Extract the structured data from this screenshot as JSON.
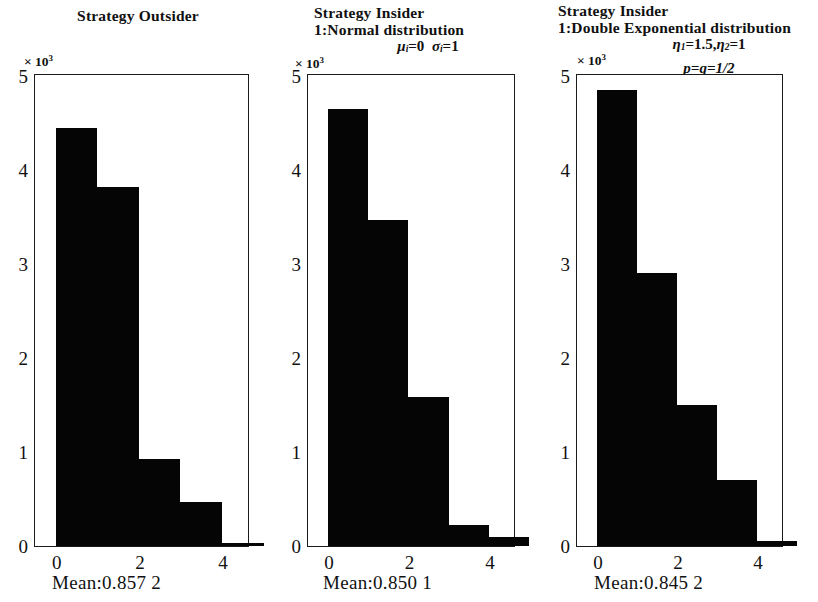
{
  "chart_data": [
    {
      "type": "bar",
      "title": "Strategy Outsider",
      "title_lines": [
        "Strategy Outsider"
      ],
      "params_lines": [],
      "exp_prefix": "× 10",
      "exp_power": "3",
      "categories": [
        "0–1",
        "1–2",
        "2–3",
        "3–4",
        "4–5"
      ],
      "values": [
        4450,
        3820,
        930,
        470,
        30
      ],
      "bin_edges": [
        0,
        1,
        2,
        3,
        4,
        5
      ],
      "xlabel": "",
      "ylabel": "",
      "xticks": [
        "0",
        "2",
        "4"
      ],
      "xtick_values": [
        0,
        2,
        4
      ],
      "yticks": [
        "0",
        "1",
        "2",
        "3",
        "4",
        "5"
      ],
      "ytick_values": [
        0,
        1000,
        2000,
        3000,
        4000,
        5000
      ],
      "ylim": [
        0,
        5000
      ],
      "xlim": [
        -0.5,
        4.6
      ],
      "grid": false,
      "legend": null,
      "caption": "Mean:0.857 2",
      "mean": 0.8572
    },
    {
      "type": "bar",
      "title": "Strategy Insider 1:Normal distribution",
      "title_lines": [
        "Strategy Insider",
        "1:Normal distribution"
      ],
      "params_lines": [
        "μᵢ=0  σᵢ=1"
      ],
      "exp_prefix": "× 10",
      "exp_power": "3",
      "categories": [
        "0–1",
        "1–2",
        "2–3",
        "3–4",
        "4–5"
      ],
      "values": [
        4650,
        3470,
        1580,
        220,
        100
      ],
      "bin_edges": [
        0,
        1,
        2,
        3,
        4,
        5
      ],
      "xlabel": "",
      "ylabel": "",
      "xticks": [
        "0",
        "2",
        "4"
      ],
      "xtick_values": [
        0,
        2,
        4
      ],
      "yticks": [
        "0",
        "1",
        "2",
        "3",
        "4",
        "5"
      ],
      "ytick_values": [
        0,
        1000,
        2000,
        3000,
        4000,
        5000
      ],
      "ylim": [
        0,
        5000
      ],
      "xlim": [
        -0.5,
        4.6
      ],
      "grid": false,
      "legend": null,
      "caption": "Mean:0.850 1",
      "mean": 0.8501
    },
    {
      "type": "bar",
      "title": "Strategy Insider 1:Double Exponential distribution",
      "title_lines": [
        "Strategy Insider",
        "1:Double Exponential distribution"
      ],
      "params_lines": [
        "η₁=1.5,η₂=1",
        "p=q=1/2"
      ],
      "exp_prefix": "× 10",
      "exp_power": "3",
      "categories": [
        "0–1",
        "1–2",
        "2–3",
        "3–4",
        "4–5"
      ],
      "values": [
        4850,
        2900,
        1500,
        700,
        50
      ],
      "bin_edges": [
        0,
        1,
        2,
        3,
        4,
        5
      ],
      "xlabel": "",
      "ylabel": "",
      "xticks": [
        "0",
        "2",
        "4"
      ],
      "xtick_values": [
        0,
        2,
        4
      ],
      "yticks": [
        "0",
        "1",
        "2",
        "3",
        "4",
        "5"
      ],
      "ytick_values": [
        0,
        1000,
        2000,
        3000,
        4000,
        5000
      ],
      "ylim": [
        0,
        5000
      ],
      "xlim": [
        -0.5,
        4.6
      ],
      "grid": false,
      "legend": null,
      "caption": "Mean:0.845 2",
      "mean": 0.8452
    }
  ],
  "panels": [
    {
      "title_line_1": "Strategy Outsider",
      "title_line_2": "",
      "param_line_1": "",
      "param_line_2": "",
      "exp_prefix": "× 10",
      "exp_power": "3",
      "caption": "Mean:0.857 2"
    },
    {
      "title_line_1": "Strategy Insider",
      "title_line_2": "1:Normal distribution",
      "param_line_1": "μ",
      "param_line_1_sub": "i",
      "param_line_1_rest": "=0",
      "param_line_2": "σ",
      "param_line_2_sub": "i",
      "param_line_2_rest": "=1",
      "exp_prefix": "× 10",
      "exp_power": "3",
      "caption": "Mean:0.850 1"
    },
    {
      "title_line_1": "Strategy Insider",
      "title_line_2": "1:Double Exponential distribution",
      "eta1": "η",
      "eta1_sub": "1",
      "eta1_rest": "=1.5,",
      "eta2": "η",
      "eta2_sub": "2",
      "eta2_rest": "=1",
      "pq": "p=q=1/2",
      "exp_prefix": "× 10",
      "exp_power": "3",
      "caption": "Mean:0.845 2"
    }
  ],
  "colors": {
    "bar": "#050505",
    "axis": "#1b1b1b",
    "background": "#ffffff",
    "text": "#111111"
  }
}
